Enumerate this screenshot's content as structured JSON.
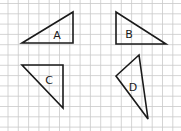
{
  "grid": {
    "spacing_px": 10.3,
    "offset_x": 8,
    "offset_y": 3.5,
    "line_color": "#c9c9c9"
  },
  "triangles": [
    {
      "label": "A",
      "points": [
        [
          22,
          43
        ],
        [
          73,
          12
        ],
        [
          73,
          43
        ]
      ],
      "label_pos": [
        57,
        35
      ]
    },
    {
      "label": "B",
      "points": [
        [
          116,
          12
        ],
        [
          116,
          44
        ],
        [
          166,
          44
        ]
      ],
      "label_pos": [
        129,
        34
      ]
    },
    {
      "label": "C",
      "points": [
        [
          22,
          65
        ],
        [
          63,
          65
        ],
        [
          63,
          108
        ]
      ],
      "label_pos": [
        49,
        80
      ]
    },
    {
      "label": "D",
      "points": [
        [
          139,
          55
        ],
        [
          116,
          76
        ],
        [
          148,
          119
        ]
      ],
      "label_pos": [
        133,
        87
      ]
    }
  ],
  "stroke_color": "#1a1a1a"
}
